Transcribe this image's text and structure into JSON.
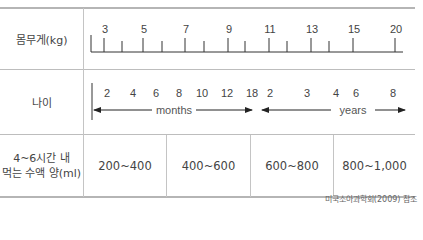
{
  "rows": {
    "weight": {
      "label": "몸무게(kg)"
    },
    "age": {
      "label": "나이"
    },
    "intake": {
      "label_line1": "4~6시간 내",
      "label_line2": "먹는 수액 양(ml)"
    }
  },
  "weight_scale": {
    "labeled_ticks": [
      "3",
      "5",
      "7",
      "9",
      "11",
      "13",
      "15",
      "20"
    ]
  },
  "age_scale": {
    "month_labels": [
      "2",
      "4",
      "6",
      "8",
      "10",
      "12",
      "18"
    ],
    "year_labels": [
      "2",
      "3",
      "4",
      "6",
      "8"
    ],
    "months_text": "months",
    "years_text": "years"
  },
  "intake_values": [
    "200~400",
    "400~600",
    "600~800",
    "800~1,000"
  ],
  "footnote": "미국소아과학회(2009) 참조",
  "colors": {
    "line": "#bdbdbd",
    "axis": "#333333",
    "text": "#444444"
  }
}
